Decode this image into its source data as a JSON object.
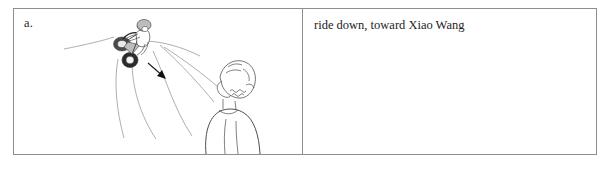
{
  "panel": {
    "label": "a."
  },
  "caption": {
    "text": "ride down, toward Xiao Wang"
  },
  "illustration": {
    "alt_name": "cyclist-riding-down-slope-toward-standing-person",
    "elements": [
      "hill-slope-line",
      "downhill-path-curve-left",
      "downhill-path-curve-middle",
      "downhill-path-curve-right",
      "cyclist-on-bicycle",
      "direction-arrow-downhill",
      "standing-person-back-view"
    ]
  },
  "colors": {
    "frame_border": "#8e8e8e",
    "ink": "#3a3a3a",
    "ink_soft": "#9a9a9a",
    "ink_dark": "#1a1a1a",
    "page_background": "#ffffff",
    "text": "#1d1d1d"
  }
}
